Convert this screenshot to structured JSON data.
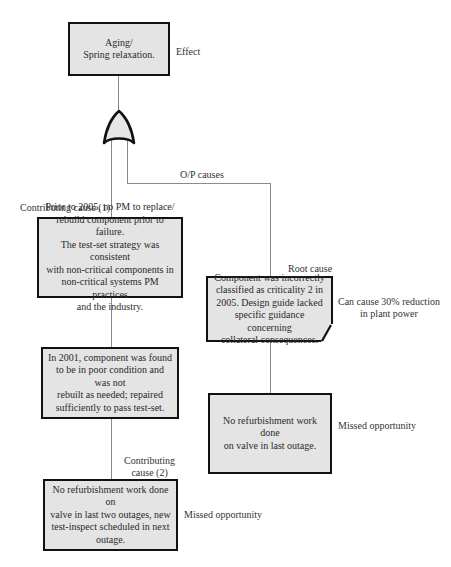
{
  "diagram": {
    "type": "fault-tree / root cause analysis",
    "effect": {
      "text": "Aging/\nSpring relaxation.",
      "label": "Effect"
    },
    "gate": {
      "type": "OR",
      "icon": "or-gate-icon"
    },
    "op_causes_label": "O/P causes",
    "contributing_cause_1": {
      "label": "Contributing cause (1)",
      "text": "Prior to 2005, no PM to replace/\nrebuild component prior to failure.\nThe test-set strategy was consistent\nwith non-critical components in\nnon-critical systems PM practices\nand the industry."
    },
    "finding_2001": {
      "text": "In 2001, component was found\nto be in poor condition and was not\nrebuilt as needed; repaired\nsufficiently to pass test-set."
    },
    "contributing_cause_2": {
      "label": "Contributing\ncause (2)",
      "text": "No refurbishment work done on\nvalve in last two outages, new\ntest-inspect scheduled in next\noutage.",
      "side_label": "Missed opportunity"
    },
    "root_cause": {
      "label": "Root cause",
      "text": "Component was incorrectly\nclassified as criticality 2 in\n2005. Design guide lacked\nspecific guidance concerning\ncollateral consequences.",
      "side_label": "Can cause 30% reduction\nin plant power"
    },
    "root_cause_followup": {
      "text": "No refurbishment work done\non valve in last outage.",
      "side_label": "Missed opportunity"
    },
    "colors": {
      "box_fill": "#e4e4e4",
      "box_border": "#111111",
      "connector": "#8a8a8a",
      "text": "#2a2a2a"
    }
  }
}
